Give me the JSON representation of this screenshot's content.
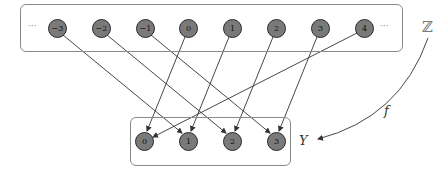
{
  "diagram": {
    "domain_set": {
      "label": "ℤ",
      "ellipsis_left": "···",
      "ellipsis_right": "···",
      "elements": [
        "−3",
        "−2",
        "−1",
        "0",
        "1",
        "2",
        "3",
        "4"
      ]
    },
    "codomain_set": {
      "label": "Y",
      "elements": [
        "0",
        "1",
        "2",
        "3"
      ]
    },
    "function_label": "f",
    "mappings": [
      {
        "from": "−3",
        "to": "1"
      },
      {
        "from": "−2",
        "to": "2"
      },
      {
        "from": "−1",
        "to": "3"
      },
      {
        "from": "0",
        "to": "0"
      },
      {
        "from": "1",
        "to": "1"
      },
      {
        "from": "2",
        "to": "2"
      },
      {
        "from": "3",
        "to": "3"
      },
      {
        "from": "4",
        "to": "0"
      }
    ],
    "colors": {
      "node_fill": "#7a7a7a",
      "node_stroke": "#2a2a2a",
      "edge": "#333333",
      "box_border": "#8a8a8a"
    }
  }
}
